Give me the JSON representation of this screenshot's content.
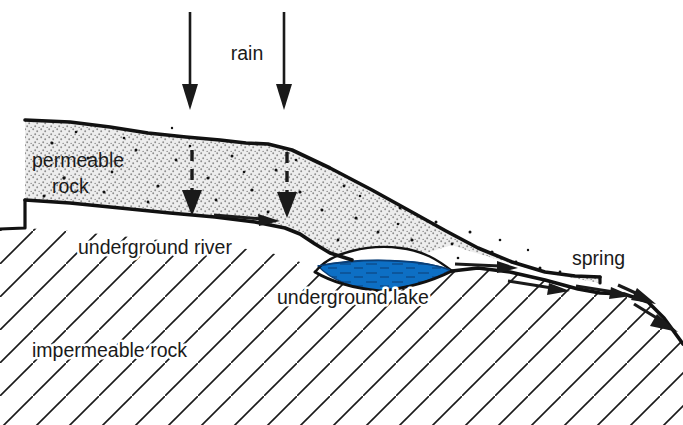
{
  "diagram": {
    "background_color": "#ffffff",
    "ink_color": "#1a1a1a",
    "labels": {
      "rain": "rain",
      "permeable_rock_line1": "permeable",
      "permeable_rock_line2": "rock",
      "underground_river": "underground river",
      "underground_lake": "underground lake",
      "impermeable_rock": "impermeable rock",
      "spring": "spring"
    },
    "layers": {
      "permeable_rock": {
        "name": "permeable rock",
        "fill_color": "#e8e8e8",
        "pattern": "stipple-dots",
        "outline_color": "#111111"
      },
      "impermeable_rock": {
        "name": "impermeable rock",
        "fill_color": "#ffffff",
        "pattern": "diagonal-hatch",
        "hatch_color": "#1a1a1a",
        "hatch_angle_deg": 45,
        "hatch_spacing_px": 33
      },
      "underground_lake": {
        "name": "underground lake",
        "water_color": "#0d6fc4",
        "water_dark_color": "#0b57a0",
        "outline_color": "#111111"
      }
    },
    "arrows": {
      "rain_arrows": {
        "name": "rain-arrows",
        "count": 2,
        "style": "solid",
        "direction": "down"
      },
      "infiltration_arrows": {
        "name": "infiltration-arrows",
        "count": 2,
        "style": "dashed",
        "direction": "down"
      },
      "river_flow_arrows": {
        "name": "river-flow-arrows",
        "count": 4,
        "style": "solid",
        "direction": "right-downslope"
      },
      "spring_outflow_arrows": {
        "name": "spring-outflow-arrows",
        "count": 2,
        "style": "solid",
        "direction": "down-right"
      }
    }
  }
}
